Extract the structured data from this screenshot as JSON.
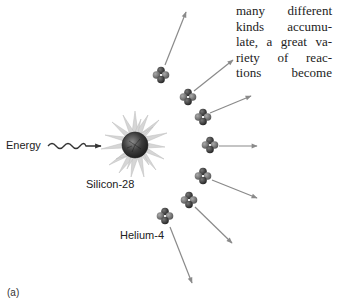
{
  "figure": {
    "panel_label": "(a)",
    "labels": {
      "energy": "Energy",
      "silicon": "Silicon-28",
      "helium": "Helium-4"
    },
    "body_text_lines": [
      "many different",
      "kinds accumu-",
      "late, a great va-",
      "riety of reac-",
      "tions become"
    ],
    "colors": {
      "arrow": "#8a8a8a",
      "core": "#3c3c3c",
      "burst": "#d4d4d4",
      "nucleon_dark": "#2e2e2e",
      "nucleon_light": "#6a6a6a"
    },
    "helium_nuclei": [
      {
        "cx": 161,
        "cy": 75,
        "arrow_from": [
          165,
          65
        ],
        "arrow_to": [
          186,
          12
        ]
      },
      {
        "cx": 188,
        "cy": 97,
        "arrow_from": [
          194,
          91
        ],
        "arrow_to": [
          233,
          60
        ]
      },
      {
        "cx": 203,
        "cy": 117,
        "arrow_from": [
          210,
          113
        ],
        "arrow_to": [
          251,
          96
        ]
      },
      {
        "cx": 210,
        "cy": 145,
        "arrow_from": [
          219,
          146
        ],
        "arrow_to": [
          257,
          146
        ]
      },
      {
        "cx": 203,
        "cy": 176,
        "arrow_from": [
          212,
          180
        ],
        "arrow_to": [
          257,
          198
        ]
      },
      {
        "cx": 189,
        "cy": 200,
        "arrow_from": [
          195,
          207
        ],
        "arrow_to": [
          232,
          243
        ]
      },
      {
        "cx": 165,
        "cy": 216,
        "arrow_from": [
          170,
          227
        ],
        "arrow_to": [
          192,
          283
        ]
      }
    ]
  }
}
